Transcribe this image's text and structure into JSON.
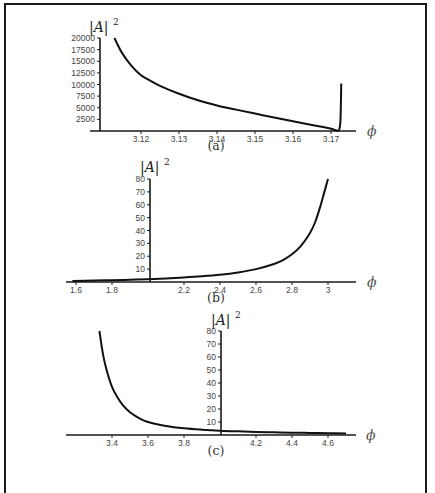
{
  "chart_data": [
    {
      "type": "line",
      "panel": "(a)",
      "caption": "(a)",
      "xlabel": "ϕ",
      "ylabel": "|A|",
      "ylabel_exp": "2",
      "x_ticks": [
        "3.12",
        "3.13",
        "3.14",
        "3.15",
        "3.16",
        "3.17"
      ],
      "x_tick_values": [
        3.12,
        3.13,
        3.14,
        3.15,
        3.16,
        3.17
      ],
      "y_ticks": [
        "2500",
        "5000",
        "7500",
        "10000",
        "12500",
        "15000",
        "17500",
        "20000"
      ],
      "y_tick_values": [
        2500,
        5000,
        7500,
        10000,
        12500,
        15000,
        17500,
        20000
      ],
      "xlim": [
        3.109,
        3.1745
      ],
      "ylim": [
        0,
        20000
      ],
      "grid": false,
      "x": [
        3.113,
        3.115,
        3.1175,
        3.12,
        3.1225,
        3.125,
        3.13,
        3.135,
        3.14,
        3.145,
        3.15,
        3.155,
        3.16,
        3.165,
        3.17,
        3.171,
        3.1718,
        3.1722,
        3.1725,
        3.1727
      ],
      "y": [
        20000,
        16800,
        14000,
        12000,
        10800,
        9700,
        8000,
        6600,
        5500,
        4600,
        3750,
        2900,
        2100,
        1300,
        500,
        200,
        60,
        400,
        2500,
        10200
      ]
    },
    {
      "type": "line",
      "panel": "(b)",
      "caption": "(b)",
      "xlabel": "ϕ",
      "ylabel": "|A|",
      "ylabel_exp": "2",
      "x_ticks": [
        "1.6",
        "1.8",
        "2.2",
        "2.4",
        "2.6",
        "2.8",
        "3"
      ],
      "x_tick_values": [
        1.6,
        1.8,
        2.2,
        2.4,
        2.6,
        2.8,
        3.0
      ],
      "y_ticks": [
        "10",
        "20",
        "30",
        "40",
        "50",
        "60",
        "70",
        "80"
      ],
      "y_tick_values": [
        10,
        20,
        30,
        40,
        50,
        60,
        70,
        80
      ],
      "y_axis_at": 2.0,
      "xlim": [
        1.56,
        3.14
      ],
      "ylim": [
        0,
        80
      ],
      "grid": false,
      "x": [
        1.58,
        1.7,
        1.8,
        1.9,
        2.0,
        2.1,
        2.2,
        2.3,
        2.4,
        2.5,
        2.6,
        2.7,
        2.75,
        2.8,
        2.85,
        2.9,
        2.93,
        2.96,
        2.98,
        3.0
      ],
      "y": [
        0.8,
        1.1,
        1.4,
        1.8,
        2.2,
        2.8,
        3.5,
        4.4,
        5.6,
        7.4,
        10.0,
        14.0,
        17.0,
        21.5,
        28.0,
        38.0,
        47.0,
        60.0,
        70.0,
        80.0
      ]
    },
    {
      "type": "line",
      "panel": "(c)",
      "caption": "(c)",
      "xlabel": "ϕ",
      "ylabel": "|A|",
      "ylabel_exp": "2",
      "x_ticks": [
        "3.4",
        "3.6",
        "3.8",
        "4.2",
        "4.4",
        "4.6"
      ],
      "x_tick_values": [
        3.4,
        3.6,
        3.8,
        4.2,
        4.4,
        4.6
      ],
      "y_ticks": [
        "10",
        "20",
        "30",
        "40",
        "50",
        "60",
        "70",
        "80"
      ],
      "y_tick_values": [
        10,
        20,
        30,
        40,
        50,
        60,
        70,
        80
      ],
      "y_axis_at": 4.0,
      "xlim": [
        3.18,
        4.74
      ],
      "ylim": [
        0,
        80
      ],
      "grid": false,
      "x": [
        3.33,
        3.35,
        3.37,
        3.4,
        3.43,
        3.46,
        3.5,
        3.55,
        3.6,
        3.7,
        3.8,
        3.9,
        4.0,
        4.1,
        4.2,
        4.3,
        4.4,
        4.5,
        4.6,
        4.7
      ],
      "y": [
        80,
        62,
        50,
        37,
        29,
        23,
        17.5,
        13,
        10,
        7,
        5.2,
        4.1,
        3.3,
        2.8,
        2.4,
        2.1,
        1.8,
        1.6,
        1.4,
        1.2
      ]
    }
  ],
  "layout": {
    "panels": [
      {
        "axis_x0": 90,
        "axis_x1": 356,
        "axis_y": 131,
        "yaxis_x": 100,
        "ytop": 38,
        "ybot": 131,
        "px_x0": 141,
        "px_per_unit_x": 3800,
        "x_ref": 3.12,
        "ytick_top_px": 38,
        "caption_y": 150,
        "caption_x": 216,
        "phi_x": 367,
        "phi_y": 136,
        "ylab_x": 89,
        "ylab_y": 32
      },
      {
        "axis_x0": 66,
        "axis_x1": 356,
        "axis_y": 282,
        "yaxis_x": 150,
        "ytop": 179,
        "ybot": 282,
        "px_x0": 76,
        "px_per_unit_x": 180,
        "x_ref": 1.6,
        "ytick_top_px": 179,
        "caption_y": 302,
        "caption_x": 216,
        "phi_x": 367,
        "phi_y": 287,
        "ylab_x": 140,
        "ylab_y": 172
      },
      {
        "axis_x0": 66,
        "axis_x1": 356,
        "axis_y": 435,
        "yaxis_x": 221,
        "ytop": 331,
        "ybot": 435,
        "px_x0": 112,
        "px_per_unit_x": 180,
        "x_ref": 3.4,
        "ytick_top_px": 331,
        "caption_y": 455,
        "caption_x": 216,
        "phi_x": 366,
        "phi_y": 440,
        "ylab_x": 211,
        "ylab_y": 325
      }
    ],
    "colors": {
      "frame": "#1a1a1a",
      "axis": "#1a1a1a",
      "curve": "#111111",
      "tick_text": "#444444"
    }
  }
}
